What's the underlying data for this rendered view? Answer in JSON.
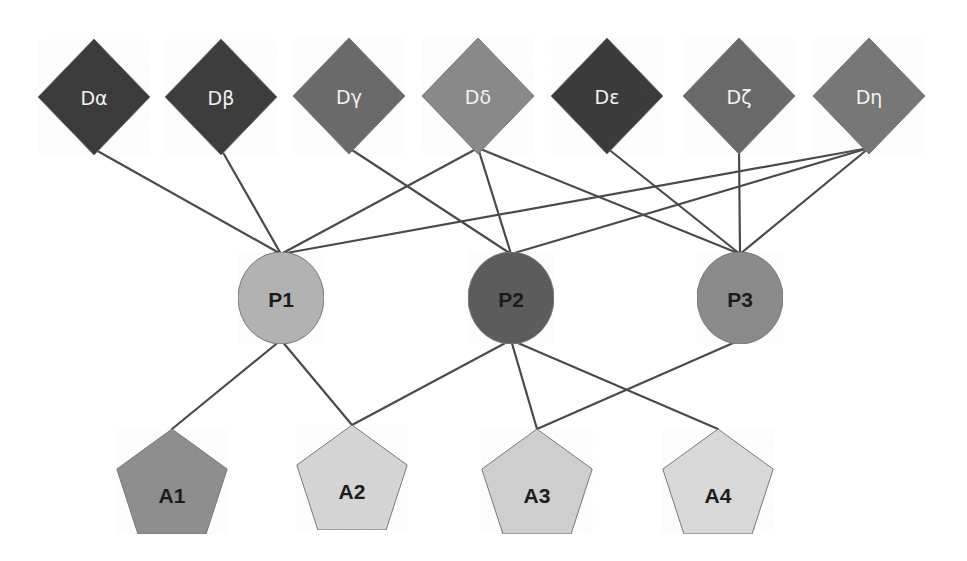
{
  "diagram": {
    "type": "layered-network",
    "layers": [
      {
        "name": "D",
        "shape": "diamond"
      },
      {
        "name": "P",
        "shape": "ellipse"
      },
      {
        "name": "A",
        "shape": "pentagon"
      }
    ],
    "d_nodes": [
      {
        "id": "Da",
        "label": "Dα",
        "cx": 94,
        "cy": 97,
        "fill": "#3b3b3b"
      },
      {
        "id": "Db",
        "label": "Dβ",
        "cx": 221,
        "cy": 97,
        "fill": "#3e3e3e"
      },
      {
        "id": "Dg",
        "label": "Dγ",
        "cx": 349,
        "cy": 96,
        "fill": "#6b6b6b"
      },
      {
        "id": "Dd",
        "label": "Dδ",
        "cx": 478,
        "cy": 96,
        "fill": "#8a8a8a"
      },
      {
        "id": "De",
        "label": "Dε",
        "cx": 607,
        "cy": 96,
        "fill": "#3a3a3a"
      },
      {
        "id": "Dz",
        "label": "Dζ",
        "cx": 739,
        "cy": 96,
        "fill": "#6a6a6a"
      },
      {
        "id": "Dh",
        "label": "Dη",
        "cx": 869,
        "cy": 96,
        "fill": "#787878"
      }
    ],
    "p_nodes": [
      {
        "id": "P1",
        "label": "P1",
        "cx": 281,
        "cy": 298,
        "fill": "#b3b3b3"
      },
      {
        "id": "P2",
        "label": "P2",
        "cx": 511,
        "cy": 298,
        "fill": "#5c5c5c"
      },
      {
        "id": "P3",
        "label": "P3",
        "cx": 740,
        "cy": 298,
        "fill": "#8c8c8c"
      }
    ],
    "a_nodes": [
      {
        "id": "A1",
        "label": "A1",
        "cx": 172,
        "cy": 487,
        "fill": "#8f8f8f"
      },
      {
        "id": "A2",
        "label": "A2",
        "cx": 352,
        "cy": 483,
        "fill": "#d6d6d6"
      },
      {
        "id": "A3",
        "label": "A3",
        "cx": 537,
        "cy": 487,
        "fill": "#d0d0d0"
      },
      {
        "id": "A4",
        "label": "A4",
        "cx": 718,
        "cy": 487,
        "fill": "#dadada"
      }
    ],
    "edges": [
      {
        "from": "Da",
        "to": "P1"
      },
      {
        "from": "Db",
        "to": "P1"
      },
      {
        "from": "Dg",
        "to": "P2"
      },
      {
        "from": "Dd",
        "to": "P1"
      },
      {
        "from": "Dd",
        "to": "P2"
      },
      {
        "from": "Dd",
        "to": "P3"
      },
      {
        "from": "De",
        "to": "P3"
      },
      {
        "from": "Dz",
        "to": "P3"
      },
      {
        "from": "Dh",
        "to": "P1"
      },
      {
        "from": "Dh",
        "to": "P2"
      },
      {
        "from": "Dh",
        "to": "P3"
      },
      {
        "from": "P1",
        "to": "A1"
      },
      {
        "from": "P1",
        "to": "A2"
      },
      {
        "from": "P2",
        "to": "A2"
      },
      {
        "from": "P2",
        "to": "A3"
      },
      {
        "from": "P2",
        "to": "A4"
      },
      {
        "from": "P3",
        "to": "A3"
      }
    ],
    "style": {
      "edge_color": "#4a4a4a",
      "background": "#ffffff"
    }
  }
}
